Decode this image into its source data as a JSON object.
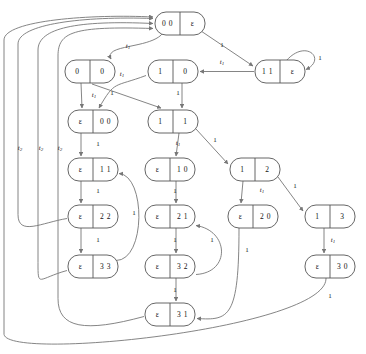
{
  "diagram": {
    "node_width": 50,
    "node_height": 23,
    "colors": {
      "node_fill": "#ffffff",
      "node_stroke": "#555555",
      "edge_stroke": "#777777",
      "text": "#111111"
    },
    "nodes": [
      {
        "id": "n00e",
        "left": "0 0",
        "right": "ε",
        "x": 155,
        "y": 12
      },
      {
        "id": "n11e",
        "left": "1 1",
        "right": "ε",
        "x": 255,
        "y": 60
      },
      {
        "id": "n0_0",
        "left": "0",
        "right": "0",
        "x": 65,
        "y": 60
      },
      {
        "id": "n1_0",
        "left": "1",
        "right": "0",
        "x": 148,
        "y": 60
      },
      {
        "id": "ne00",
        "left": "ε",
        "right": "0 0",
        "x": 68,
        "y": 110
      },
      {
        "id": "n1_1",
        "left": "1",
        "right": "1",
        "x": 148,
        "y": 110
      },
      {
        "id": "ne11",
        "left": "ε",
        "right": "1 1",
        "x": 68,
        "y": 158
      },
      {
        "id": "n1_2",
        "left": "1",
        "right": "2",
        "x": 230,
        "y": 158
      },
      {
        "id": "ne10",
        "left": "ε",
        "right": "1 0",
        "x": 145,
        "y": 158
      },
      {
        "id": "ne22",
        "left": "ε",
        "right": "2 2",
        "x": 68,
        "y": 205
      },
      {
        "id": "ne21",
        "left": "ε",
        "right": "2 1",
        "x": 145,
        "y": 205
      },
      {
        "id": "ne20",
        "left": "ε",
        "right": "2 0",
        "x": 228,
        "y": 205
      },
      {
        "id": "n1_3",
        "left": "1",
        "right": "3",
        "x": 305,
        "y": 205
      },
      {
        "id": "ne33",
        "left": "ε",
        "right": "3 3",
        "x": 68,
        "y": 255
      },
      {
        "id": "ne32",
        "left": "ε",
        "right": "3 2",
        "x": 145,
        "y": 255
      },
      {
        "id": "ne30",
        "left": "ε",
        "right": "3 0",
        "x": 305,
        "y": 255
      },
      {
        "id": "ne31",
        "left": "ε",
        "right": "3 1",
        "x": 145,
        "y": 303
      }
    ],
    "edges": [
      {
        "id": "e-root-11e",
        "from": "n00e",
        "to": "n11e",
        "label": "1",
        "italic": false,
        "lx": 222,
        "ly": 45
      },
      {
        "id": "e-11e-self",
        "from": "n11e",
        "to": "n11e",
        "label": "1",
        "italic": false,
        "lx": 320,
        "ly": 58
      },
      {
        "id": "e-11e-1_0",
        "from": "n11e",
        "to": "n1_0",
        "label": "t",
        "sub": "1",
        "italic": true,
        "lx": 222,
        "ly": 62
      },
      {
        "id": "e-root-0_0",
        "from": "n00e",
        "to": "n0_0",
        "label": "t",
        "sub": "1",
        "italic": true,
        "lx": 128,
        "ly": 46
      },
      {
        "id": "e-0_0-ne00",
        "from": "n0_0",
        "to": "ne00",
        "label": "t",
        "sub": "1",
        "italic": true,
        "lx": 94,
        "ly": 95
      },
      {
        "id": "e-1_0-ne00",
        "from": "n1_0",
        "to": "ne00",
        "label": "t",
        "sub": "1",
        "italic": true,
        "lx": 122,
        "ly": 74
      },
      {
        "id": "e-0_0-1_1",
        "from": "n0_0",
        "to": "n1_1",
        "label": "1",
        "italic": false,
        "lx": 112,
        "ly": 93
      },
      {
        "id": "e-1_0-1_1",
        "from": "n1_0",
        "to": "n1_1",
        "label": "1",
        "italic": false,
        "lx": 178,
        "ly": 93
      },
      {
        "id": "e-ne00-ne11",
        "from": "ne00",
        "to": "ne11",
        "label": "1",
        "italic": false,
        "lx": 98,
        "ly": 144
      },
      {
        "id": "e-1_1-ne10",
        "from": "n1_1",
        "to": "ne10",
        "label": "t",
        "sub": "1",
        "italic": true,
        "lx": 178,
        "ly": 143
      },
      {
        "id": "e-1_1-1_2",
        "from": "n1_1",
        "to": "n1_2",
        "label": "1",
        "italic": false,
        "lx": 215,
        "ly": 140
      },
      {
        "id": "e-ne11-ne22",
        "from": "ne11",
        "to": "ne22",
        "label": "1",
        "italic": false,
        "lx": 98,
        "ly": 191
      },
      {
        "id": "e-ne10-ne21",
        "from": "ne10",
        "to": "ne21",
        "label": "1",
        "italic": false,
        "lx": 175,
        "ly": 191
      },
      {
        "id": "e-1_2-ne20",
        "from": "n1_2",
        "to": "ne20",
        "label": "t",
        "sub": "1",
        "italic": true,
        "lx": 262,
        "ly": 190
      },
      {
        "id": "e-1_2-1_3",
        "from": "n1_2",
        "to": "n1_3",
        "label": "1",
        "italic": false,
        "lx": 295,
        "ly": 186
      },
      {
        "id": "e-ne22-ne33",
        "from": "ne22",
        "to": "ne33",
        "label": "1",
        "italic": false,
        "lx": 98,
        "ly": 240
      },
      {
        "id": "e-ne21-ne32",
        "from": "ne21",
        "to": "ne32",
        "label": "1",
        "italic": false,
        "lx": 175,
        "ly": 240
      },
      {
        "id": "e-1_3-ne30",
        "from": "n1_3",
        "to": "ne30",
        "label": "t",
        "sub": "1",
        "italic": true,
        "lx": 333,
        "ly": 240
      },
      {
        "id": "e-ne33-ne11",
        "from": "ne33",
        "to": "ne11",
        "label": "1",
        "italic": false,
        "lx": 134,
        "ly": 213
      },
      {
        "id": "e-ne32-ne31",
        "from": "ne32",
        "to": "ne31",
        "label": "1",
        "italic": false,
        "lx": 175,
        "ly": 290
      },
      {
        "id": "e-ne32-ne21",
        "from": "ne32",
        "to": "ne21",
        "label": "1",
        "italic": false,
        "lx": 212,
        "ly": 240
      },
      {
        "id": "e-ne20-ne31",
        "from": "ne20",
        "to": "ne31",
        "label": "1",
        "italic": false,
        "lx": 247,
        "ly": 250
      },
      {
        "id": "e-ne30-left",
        "from": "ne30",
        "to": "n00e",
        "label": "1",
        "italic": false,
        "lx": 330,
        "ly": 296
      },
      {
        "id": "e-ne22-root",
        "from": "ne22",
        "to": "n00e",
        "label": "t",
        "sub": "2",
        "italic": true,
        "lx": 20,
        "ly": 148
      },
      {
        "id": "e-ne33-root",
        "from": "ne33",
        "to": "n00e",
        "label": "t",
        "sub": "2",
        "italic": true,
        "lx": 41,
        "ly": 148
      },
      {
        "id": "e-ne31-root",
        "from": "ne31",
        "to": "n00e",
        "label": "t",
        "sub": "2",
        "italic": true,
        "lx": 60,
        "ly": 148
      }
    ]
  }
}
